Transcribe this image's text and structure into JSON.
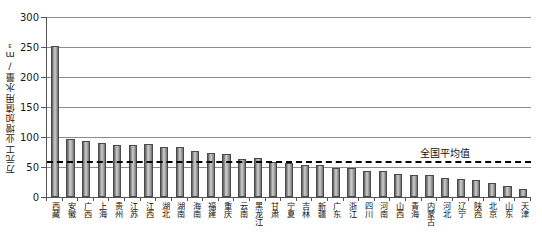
{
  "chart_data": {
    "type": "bar",
    "title": "",
    "xlabel": "",
    "ylabel": "万元工业增加值用水量/m³",
    "ylim": [
      0,
      300
    ],
    "yticks": [
      0,
      50,
      100,
      150,
      200,
      250,
      300
    ],
    "grid": true,
    "legend": "none",
    "categories": [
      "西藏",
      "安徽",
      "广西",
      "上海",
      "贵州",
      "江苏",
      "江西",
      "湖北",
      "湖南",
      "海南",
      "福建",
      "重庆",
      "云南",
      "黑龙江",
      "甘肃",
      "宁夏",
      "吉林",
      "新疆",
      "广东",
      "浙江",
      "四川",
      "河南",
      "山西",
      "青海",
      "内蒙古",
      "河北",
      "辽宁",
      "陕西",
      "北京",
      "山东",
      "天津"
    ],
    "values": [
      252,
      96,
      94,
      90,
      87,
      87,
      88,
      83,
      83,
      76,
      74,
      72,
      64,
      65,
      59,
      57,
      54,
      53,
      49,
      48,
      44,
      44,
      38,
      37,
      36,
      31,
      30,
      29,
      24,
      18,
      14
    ],
    "series": [
      {
        "name": "万元工业增加值用水量",
        "values": [
          252,
          96,
          94,
          90,
          87,
          87,
          88,
          83,
          83,
          76,
          74,
          72,
          64,
          65,
          59,
          57,
          54,
          53,
          49,
          48,
          44,
          44,
          38,
          37,
          36,
          31,
          30,
          29,
          24,
          18,
          14
        ]
      }
    ],
    "annotations": [
      {
        "name": "national-average",
        "label": "全国平均值",
        "value": 60,
        "style": "dashed-horizontal-line"
      }
    ],
    "colors": {
      "bar_fill_light": "#c9c9c9",
      "bar_fill_dark": "#6e6e6e",
      "bar_stroke": "#4a4a4a",
      "grid": "#8c8c8c",
      "axis": "#555555",
      "annotation_line": "#000000",
      "text": "#111111",
      "background": "#ffffff"
    }
  }
}
